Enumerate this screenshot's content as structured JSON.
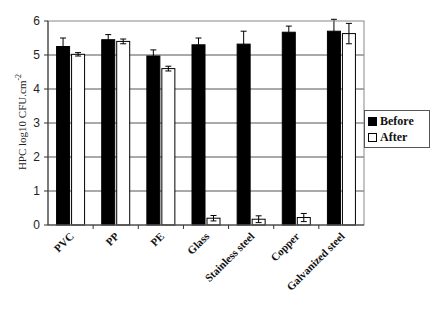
{
  "chart_data": {
    "type": "bar",
    "title": "",
    "xlabel": "",
    "ylabel": "HPC log10 CFU.cm-2",
    "ylabel_superscript": "-2",
    "ylabel_base": "HPC log10 CFU.cm",
    "ylim": [
      0,
      6
    ],
    "yticks": [
      "0",
      "1",
      "2",
      "3",
      "4",
      "5",
      "6"
    ],
    "grid": true,
    "legend_position": "right",
    "categories": [
      "PVC",
      "PP",
      "PE",
      "Glass",
      "Stainless steel",
      "Copper",
      "Galvanized  steel"
    ],
    "series": [
      {
        "name": "Before",
        "color": "#000000",
        "values": [
          5.25,
          5.45,
          4.97,
          5.3,
          5.32,
          5.67,
          5.7
        ],
        "errors": [
          0.25,
          0.15,
          0.18,
          0.2,
          0.38,
          0.18,
          0.35
        ]
      },
      {
        "name": "After",
        "color": "#ffffff",
        "values": [
          5.02,
          5.4,
          4.6,
          0.2,
          0.17,
          0.22,
          5.63
        ],
        "errors": [
          0.05,
          0.07,
          0.07,
          0.08,
          0.1,
          0.12,
          0.3
        ]
      }
    ]
  },
  "legend": {
    "items": [
      {
        "label": "Before",
        "color": "#000000"
      },
      {
        "label": "After",
        "color": "#ffffff"
      }
    ]
  }
}
